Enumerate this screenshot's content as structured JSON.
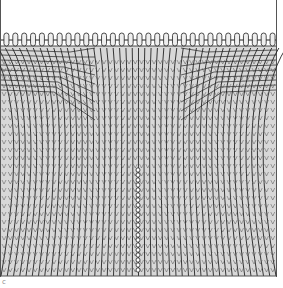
{
  "figure": {
    "caption_mark": "c",
    "colors": {
      "background": "#ffffff",
      "stitch_fill": "#d8d8d8",
      "stitch_line": "#222222",
      "border": "#555555"
    },
    "cast_on_loops": 31,
    "stitch_columns": 44
  }
}
